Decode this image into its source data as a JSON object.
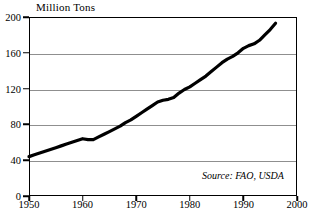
{
  "chart_data": {
    "type": "line",
    "title": "Million Tons",
    "xlabel": "",
    "ylabel": "Million Tons",
    "xlim": [
      1950,
      2000
    ],
    "ylim": [
      0,
      200
    ],
    "grid": true,
    "legend": false,
    "y_ticks": [
      0,
      40,
      80,
      120,
      160,
      200
    ],
    "x_ticks": [
      1950,
      1960,
      1970,
      1980,
      1990,
      2000
    ],
    "annotation": "Source: FAO, USDA",
    "series": [
      {
        "name": "Production",
        "x": [
          1950,
          1951,
          1952,
          1953,
          1954,
          1955,
          1956,
          1957,
          1958,
          1959,
          1960,
          1961,
          1962,
          1963,
          1964,
          1965,
          1966,
          1967,
          1968,
          1969,
          1970,
          1971,
          1972,
          1973,
          1974,
          1975,
          1976,
          1977,
          1978,
          1979,
          1980,
          1981,
          1982,
          1983,
          1984,
          1985,
          1986,
          1987,
          1988,
          1989,
          1990,
          1991,
          1992,
          1993,
          1994,
          1995,
          1996
        ],
        "values": [
          44,
          46,
          48,
          50,
          52,
          54,
          56,
          58,
          60,
          62,
          64,
          63,
          63,
          66,
          69,
          72,
          75,
          78,
          82,
          85,
          89,
          93,
          97,
          101,
          105,
          107,
          108,
          110,
          115,
          119,
          122,
          126,
          130,
          134,
          139,
          144,
          149,
          153,
          156,
          160,
          165,
          168,
          170,
          174,
          180,
          186,
          193
        ]
      }
    ]
  }
}
